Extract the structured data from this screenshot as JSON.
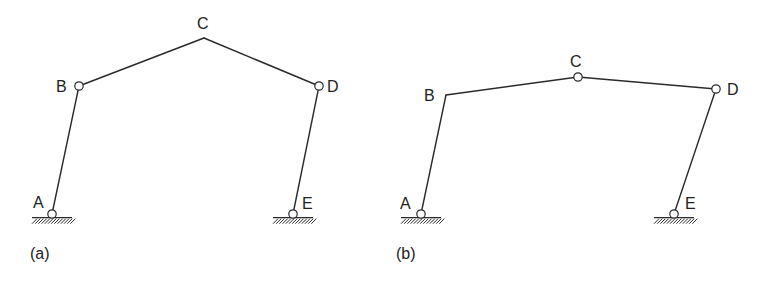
{
  "figures": [
    {
      "id": "a",
      "caption": "(a)",
      "caption_pos": [
        30,
        259
      ],
      "nodes": {
        "A": {
          "label": "A",
          "x": 52,
          "y": 214,
          "hinge": true,
          "support": true,
          "label_pos": [
            33,
            208
          ]
        },
        "B": {
          "label": "B",
          "x": 79,
          "y": 86,
          "hinge": true,
          "support": false,
          "label_pos": [
            56,
            92
          ]
        },
        "C": {
          "label": "C",
          "x": 204,
          "y": 38,
          "hinge": false,
          "support": false,
          "label_pos": [
            197,
            29
          ]
        },
        "D": {
          "label": "D",
          "x": 319,
          "y": 86,
          "hinge": true,
          "support": false,
          "label_pos": [
            327,
            92
          ]
        },
        "E": {
          "label": "E",
          "x": 293,
          "y": 214,
          "hinge": true,
          "support": true,
          "label_pos": [
            302,
            209
          ]
        }
      },
      "members": [
        [
          "A",
          "B"
        ],
        [
          "B",
          "C"
        ],
        [
          "C",
          "D"
        ],
        [
          "D",
          "E"
        ]
      ]
    },
    {
      "id": "b",
      "caption": "(b)",
      "caption_pos": [
        396,
        259
      ],
      "nodes": {
        "A": {
          "label": "A",
          "x": 421,
          "y": 214,
          "hinge": true,
          "support": true,
          "label_pos": [
            400,
            209
          ]
        },
        "B": {
          "label": "B",
          "x": 446,
          "y": 95,
          "hinge": false,
          "support": false,
          "label_pos": [
            424,
            101
          ]
        },
        "C": {
          "label": "C",
          "x": 578,
          "y": 77,
          "hinge": true,
          "support": false,
          "label_pos": [
            570,
            67
          ]
        },
        "D": {
          "label": "D",
          "x": 716,
          "y": 89,
          "hinge": true,
          "support": false,
          "label_pos": [
            727,
            95
          ]
        },
        "E": {
          "label": "E",
          "x": 674,
          "y": 214,
          "hinge": true,
          "support": true,
          "label_pos": [
            685,
            209
          ]
        }
      },
      "members": [
        [
          "A",
          "B"
        ],
        [
          "B",
          "C"
        ],
        [
          "C",
          "D"
        ],
        [
          "D",
          "E"
        ]
      ]
    }
  ],
  "style": {
    "line_color": "#2a2a2a",
    "hinge_radius": 4.2,
    "support_half_width": 20
  }
}
